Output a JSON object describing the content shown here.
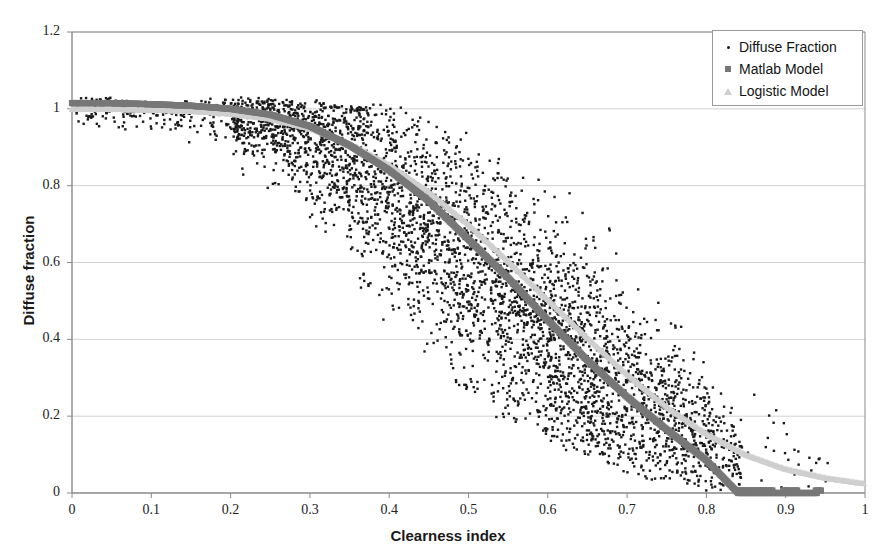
{
  "chart_data": {
    "type": "scatter",
    "title": "",
    "xlabel": "Clearness index",
    "ylabel": "Diffuse fraction",
    "xlim": [
      0,
      1
    ],
    "ylim": [
      0,
      1.2
    ],
    "grid": true,
    "grid_axis": "y",
    "legend_position": "top-right",
    "xticks": [
      "0",
      "0.1",
      "0.2",
      "0.3",
      "0.4",
      "0.5",
      "0.6",
      "0.7",
      "0.8",
      "0.9",
      "1"
    ],
    "xtick_values": [
      0,
      0.1,
      0.2,
      0.3,
      0.4,
      0.5,
      0.6,
      0.7,
      0.8,
      0.9,
      1
    ],
    "yticks": [
      "0",
      "0.2",
      "0.4",
      "0.6",
      "0.8",
      "1",
      "1.2"
    ],
    "ytick_values": [
      0,
      0.2,
      0.4,
      0.6,
      0.8,
      1,
      1.2
    ],
    "series": [
      {
        "name": "Diffuse Fraction",
        "marker": "dot",
        "color": "#1a1a1a",
        "kind": "scatter-cloud",
        "n_points": 4200,
        "description": "Dense measured data cloud that decreases from diffuse fraction near 1.0 at low clearness index to near 0.05-0.2 at clearness index 0.8, with wide vertical spread peaking between 0.3 and 0.7.",
        "envelope_x": [
          0.0,
          0.05,
          0.1,
          0.15,
          0.2,
          0.25,
          0.3,
          0.35,
          0.4,
          0.45,
          0.5,
          0.55,
          0.6,
          0.65,
          0.7,
          0.75,
          0.8,
          0.85,
          0.9,
          0.95
        ],
        "envelope_upper": [
          1.02,
          1.02,
          1.02,
          1.02,
          1.02,
          1.02,
          1.02,
          1.01,
          1.0,
          0.97,
          0.93,
          0.88,
          0.82,
          0.74,
          0.63,
          0.5,
          0.38,
          0.2,
          0.1,
          0.06
        ],
        "envelope_lower": [
          0.9,
          0.9,
          0.9,
          0.88,
          0.85,
          0.78,
          0.68,
          0.55,
          0.43,
          0.33,
          0.25,
          0.19,
          0.14,
          0.1,
          0.07,
          0.04,
          0.02,
          0.0,
          0.0,
          0.0
        ],
        "envelope_center": [
          1.01,
          1.01,
          1.0,
          0.99,
          0.98,
          0.96,
          0.92,
          0.86,
          0.78,
          0.69,
          0.6,
          0.51,
          0.42,
          0.33,
          0.26,
          0.2,
          0.15,
          0.08,
          0.04,
          0.03
        ]
      },
      {
        "name": "Matlab Model",
        "marker": "square",
        "color": "#777777",
        "kind": "model-curve",
        "x": [
          0.0,
          0.05,
          0.1,
          0.15,
          0.2,
          0.25,
          0.3,
          0.35,
          0.4,
          0.45,
          0.5,
          0.55,
          0.6,
          0.65,
          0.7,
          0.75,
          0.8,
          0.84,
          0.88,
          0.9,
          0.94
        ],
        "y": [
          1.015,
          1.015,
          1.012,
          1.008,
          1.0,
          0.985,
          0.955,
          0.905,
          0.84,
          0.76,
          0.66,
          0.56,
          0.45,
          0.345,
          0.25,
          0.165,
          0.085,
          0.0,
          0.0,
          0.0,
          0.0
        ]
      },
      {
        "name": "Logistic Model",
        "marker": "triangle",
        "color": "#cfcfcf",
        "kind": "model-curve",
        "x": [
          0.0,
          0.05,
          0.1,
          0.15,
          0.2,
          0.25,
          0.3,
          0.35,
          0.4,
          0.45,
          0.5,
          0.55,
          0.6,
          0.65,
          0.7,
          0.75,
          0.8,
          0.85,
          0.9,
          0.95,
          1.0
        ],
        "y": [
          1.0,
          1.0,
          0.998,
          0.995,
          0.988,
          0.975,
          0.95,
          0.91,
          0.855,
          0.785,
          0.7,
          0.605,
          0.505,
          0.405,
          0.31,
          0.225,
          0.155,
          0.1,
          0.063,
          0.04,
          0.025
        ]
      }
    ]
  },
  "legend": {
    "items": [
      {
        "label": "Diffuse Fraction",
        "marker": "dot-icon"
      },
      {
        "label": "Matlab Model",
        "marker": "square-icon"
      },
      {
        "label": "Logistic Model",
        "marker": "triangle-icon"
      }
    ]
  },
  "colors": {
    "scatter": "#1a1a1a",
    "matlab": "#777777",
    "logistic": "#cfcfcf",
    "axis": "#8a8a8a",
    "grid": "#d0d0d0",
    "text": "#1a1a1a",
    "background": "#ffffff"
  }
}
